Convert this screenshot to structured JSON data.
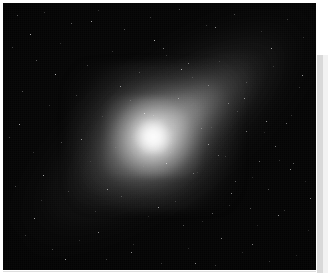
{
  "image": {
    "subject": "comet",
    "kind": "astronomical-photograph",
    "palette": "grayscale",
    "alt_text": "Grayscale astronomical photograph of a comet with a bright condensed coma and nucleus at lower right and a broad diffuse dust tail fanning toward the upper left across a black star field.",
    "background_color": "#000000",
    "nucleus_color": "#ffffff",
    "coma_color": "#e6e6e6",
    "tail_color": "#9a9a9a",
    "margin_color": "#ffffff",
    "right_band_color": "#d9d9d9"
  },
  "features": {
    "nucleus_label": "comet nucleus",
    "coma_label": "coma",
    "tail_label": "dust tail",
    "starfield_label": "background star field",
    "plate_label": "photographic plate"
  },
  "frame": {
    "left_margin_label": "left white margin",
    "top_margin_label": "top white margin",
    "right_band_label": "right gray scan band",
    "bottom_scanline_label": "bottom scan line"
  }
}
